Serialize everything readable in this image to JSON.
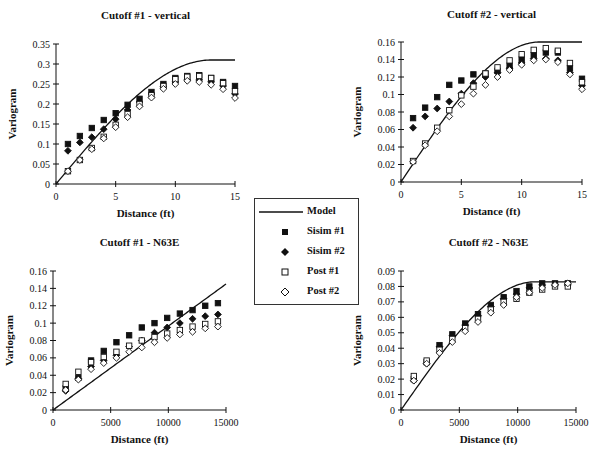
{
  "figure": {
    "legend": {
      "items": [
        {
          "name": "Model",
          "marker": "line"
        },
        {
          "name": "Sisim #1",
          "marker": "filled-square"
        },
        {
          "name": "Sisim #2",
          "marker": "filled-diamond"
        },
        {
          "name": "Post #1",
          "marker": "open-square"
        },
        {
          "name": "Post #2",
          "marker": "open-diamond"
        }
      ]
    },
    "colors": {
      "ink": "#111111",
      "background": "#ffffff"
    }
  },
  "chart_data": [
    {
      "type": "scatter",
      "title": "Cutoff #1 - vertical",
      "xlabel": "Distance (ft)",
      "ylabel": "Variogram",
      "xlim": [
        0,
        15
      ],
      "ylim": [
        0,
        0.35
      ],
      "xticks": [
        "0",
        "5",
        "10",
        "15"
      ],
      "xtick_values": [
        0,
        5,
        10,
        15
      ],
      "yticks": [
        "0",
        "0.05",
        "0.1",
        "0.15",
        "0.2",
        "0.25",
        "0.3",
        "0.35"
      ],
      "ytick_values": [
        0,
        0.05,
        0.1,
        0.15,
        0.2,
        0.25,
        0.3,
        0.35
      ],
      "grid": false,
      "x": [
        1,
        2,
        3,
        4,
        5,
        6,
        7,
        8,
        9,
        10,
        11,
        12,
        13,
        14,
        15
      ],
      "model": {
        "type": "spherical",
        "sill": 0.31,
        "range": 13
      },
      "series": [
        {
          "name": "Sisim #1",
          "values": [
            0.1,
            0.12,
            0.14,
            0.16,
            0.177,
            0.198,
            0.213,
            0.23,
            0.25,
            0.265,
            0.27,
            0.272,
            0.265,
            0.255,
            0.245
          ]
        },
        {
          "name": "Sisim #2",
          "values": [
            0.083,
            0.104,
            0.117,
            0.137,
            0.162,
            0.185,
            0.205,
            0.225,
            0.243,
            0.255,
            0.26,
            0.26,
            0.255,
            0.245,
            0.225
          ]
        },
        {
          "name": "Post #1",
          "values": [
            0.032,
            0.06,
            0.09,
            0.118,
            0.148,
            0.175,
            0.2,
            0.222,
            0.245,
            0.262,
            0.268,
            0.27,
            0.265,
            0.252,
            0.232
          ]
        },
        {
          "name": "Post #2",
          "values": [
            0.032,
            0.06,
            0.087,
            0.114,
            0.142,
            0.167,
            0.194,
            0.216,
            0.238,
            0.25,
            0.258,
            0.255,
            0.248,
            0.237,
            0.215
          ]
        }
      ]
    },
    {
      "type": "scatter",
      "title": "Cutoff #2 - vertical",
      "xlabel": "Distance (ft)",
      "ylabel": "Variogram",
      "xlim": [
        0,
        15
      ],
      "ylim": [
        0,
        0.16
      ],
      "xticks": [
        "0",
        "5",
        "10",
        "15"
      ],
      "xtick_values": [
        0,
        5,
        10,
        15
      ],
      "yticks": [
        "0",
        "0.02",
        "0.04",
        "0.06",
        "0.08",
        "0.1",
        "0.12",
        "0.14",
        "0.16"
      ],
      "ytick_values": [
        0,
        0.02,
        0.04,
        0.06,
        0.08,
        0.1,
        0.12,
        0.14,
        0.16
      ],
      "grid": false,
      "x": [
        1,
        2,
        3,
        4,
        5,
        6,
        7,
        8,
        9,
        10,
        11,
        12,
        13,
        14,
        15
      ],
      "model": {
        "type": "spherical",
        "sill": 0.16,
        "range": 11.5
      },
      "series": [
        {
          "name": "Sisim #1",
          "values": [
            0.073,
            0.085,
            0.097,
            0.111,
            0.116,
            0.123,
            0.124,
            0.127,
            0.133,
            0.14,
            0.145,
            0.148,
            0.148,
            0.13,
            0.118
          ]
        },
        {
          "name": "Sisim #2",
          "values": [
            0.062,
            0.075,
            0.084,
            0.092,
            0.101,
            0.113,
            0.12,
            0.125,
            0.13,
            0.136,
            0.141,
            0.141,
            0.139,
            0.125,
            0.11
          ]
        },
        {
          "name": "Post #1",
          "values": [
            0.024,
            0.044,
            0.062,
            0.082,
            0.099,
            0.109,
            0.124,
            0.131,
            0.139,
            0.146,
            0.151,
            0.153,
            0.15,
            0.136,
            0.114
          ]
        },
        {
          "name": "Post #2",
          "values": [
            0.023,
            0.042,
            0.058,
            0.075,
            0.089,
            0.101,
            0.111,
            0.12,
            0.128,
            0.134,
            0.139,
            0.14,
            0.137,
            0.123,
            0.106
          ]
        }
      ]
    },
    {
      "type": "scatter",
      "title": "Cutoff #1 - N63E",
      "xlabel": "Distance (ft)",
      "ylabel": "Variogram",
      "xlim": [
        0,
        15000
      ],
      "ylim": [
        0,
        0.16
      ],
      "xticks": [
        "0",
        "5000",
        "10000",
        "15000"
      ],
      "xtick_values": [
        0,
        5000,
        10000,
        15000
      ],
      "yticks": [
        "0",
        "0.02",
        "0.04",
        "0.06",
        "0.08",
        "0.1",
        "0.12",
        "0.14",
        "0.16"
      ],
      "ytick_values": [
        0,
        0.02,
        0.04,
        0.06,
        0.08,
        0.1,
        0.12,
        0.14,
        0.16
      ],
      "grid": false,
      "x": [
        1100,
        2200,
        3300,
        4400,
        5500,
        6600,
        7700,
        8800,
        9900,
        11000,
        12100,
        13200,
        14300
      ],
      "model": {
        "type": "linear",
        "slope_per_15000": 0.145
      },
      "series": [
        {
          "name": "Sisim #1",
          "values": [
            0.025,
            0.037,
            0.057,
            0.068,
            0.078,
            0.086,
            0.095,
            0.1,
            0.106,
            0.111,
            0.115,
            0.12,
            0.123
          ]
        },
        {
          "name": "Sisim #2",
          "values": [
            0.022,
            0.036,
            0.05,
            0.057,
            0.063,
            0.073,
            0.08,
            0.089,
            0.095,
            0.1,
            0.105,
            0.108,
            0.11
          ]
        },
        {
          "name": "Post #1",
          "values": [
            0.03,
            0.044,
            0.055,
            0.061,
            0.067,
            0.074,
            0.08,
            0.084,
            0.088,
            0.092,
            0.096,
            0.099,
            0.102
          ]
        },
        {
          "name": "Post #2",
          "values": [
            0.023,
            0.035,
            0.047,
            0.054,
            0.06,
            0.067,
            0.072,
            0.078,
            0.083,
            0.087,
            0.09,
            0.094,
            0.096
          ]
        }
      ]
    },
    {
      "type": "scatter",
      "title": "Cutoff #2 - N63E",
      "xlabel": "Distance (ft)",
      "ylabel": "Variogram",
      "xlim": [
        0,
        15000
      ],
      "ylim": [
        0,
        0.09
      ],
      "xticks": [
        "0",
        "5000",
        "10000",
        "15000"
      ],
      "xtick_values": [
        0,
        5000,
        10000,
        15000
      ],
      "yticks": [
        "0",
        "0.01",
        "0.02",
        "0.03",
        "0.04",
        "0.05",
        "0.06",
        "0.07",
        "0.08",
        "0.09"
      ],
      "ytick_values": [
        0,
        0.01,
        0.02,
        0.03,
        0.04,
        0.05,
        0.06,
        0.07,
        0.08,
        0.09
      ],
      "grid": false,
      "x": [
        1100,
        2200,
        3300,
        4400,
        5500,
        6600,
        7700,
        8800,
        9900,
        11000,
        12100,
        13200,
        14300
      ],
      "model": {
        "type": "spherical",
        "sill": 0.083,
        "range": 11500
      },
      "series": [
        {
          "name": "Sisim #1",
          "values": [
            0.02,
            0.031,
            0.042,
            0.049,
            0.056,
            0.062,
            0.068,
            0.073,
            0.077,
            0.08,
            0.082,
            0.082,
            0.082
          ]
        },
        {
          "name": "Sisim #2",
          "values": [
            0.019,
            0.03,
            0.041,
            0.048,
            0.055,
            0.061,
            0.067,
            0.072,
            0.075,
            0.079,
            0.081,
            0.081,
            0.081
          ]
        },
        {
          "name": "Post #1",
          "values": [
            0.022,
            0.032,
            0.039,
            0.046,
            0.053,
            0.059,
            0.065,
            0.07,
            0.072,
            0.076,
            0.078,
            0.08,
            0.08
          ]
        },
        {
          "name": "Post #2",
          "values": [
            0.019,
            0.03,
            0.037,
            0.044,
            0.051,
            0.057,
            0.063,
            0.068,
            0.073,
            0.076,
            0.079,
            0.081,
            0.082
          ]
        }
      ]
    }
  ]
}
